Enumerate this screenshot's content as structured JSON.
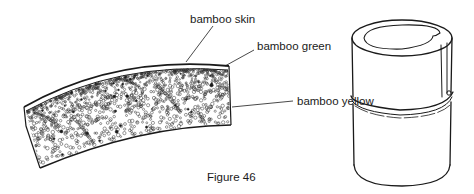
{
  "figure": {
    "caption": "Figure 46",
    "labels": {
      "skin": "bamboo skin",
      "green": "bamboo green",
      "yellow": "bamboo yellow"
    },
    "parts": [
      "bamboo-cross-section-strip",
      "bamboo-tube-segment"
    ],
    "colors": {
      "ink": "#1a1a1a",
      "background": "#ffffff"
    }
  }
}
